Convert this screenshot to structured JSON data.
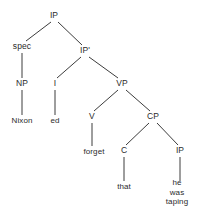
{
  "diagram": {
    "type": "constituency-tree",
    "width": 202,
    "height": 212,
    "background_color": "#ffffff",
    "line_color": "#3c3c3c",
    "text_color": "#2b2b2b",
    "nodes": [
      {
        "id": "ip-root",
        "label": "IP",
        "x": 54,
        "y": 16,
        "kind": "category"
      },
      {
        "id": "spec",
        "label": "spec",
        "x": 22,
        "y": 47,
        "kind": "category"
      },
      {
        "id": "ip-bar",
        "label": "IP'",
        "x": 85,
        "y": 51,
        "kind": "category"
      },
      {
        "id": "np",
        "label": "NP",
        "x": 22,
        "y": 84,
        "kind": "category"
      },
      {
        "id": "i",
        "label": "I",
        "x": 55,
        "y": 84,
        "kind": "category"
      },
      {
        "id": "vp",
        "label": "VP",
        "x": 122,
        "y": 84,
        "kind": "category"
      },
      {
        "id": "nixon",
        "label": "Nixon",
        "x": 22,
        "y": 121,
        "kind": "terminal"
      },
      {
        "id": "ed",
        "label": "ed",
        "x": 55,
        "y": 121,
        "kind": "terminal"
      },
      {
        "id": "v",
        "label": "V",
        "x": 92,
        "y": 117,
        "kind": "category"
      },
      {
        "id": "cp",
        "label": "CP",
        "x": 153,
        "y": 117,
        "kind": "category"
      },
      {
        "id": "forget",
        "label": "forget",
        "x": 94,
        "y": 152,
        "kind": "terminal"
      },
      {
        "id": "c",
        "label": "C",
        "x": 124,
        "y": 151,
        "kind": "category"
      },
      {
        "id": "ip-embed",
        "label": "IP",
        "x": 180,
        "y": 151,
        "kind": "category"
      },
      {
        "id": "that",
        "label": "that",
        "x": 124,
        "y": 187,
        "kind": "terminal"
      },
      {
        "id": "hewastaping",
        "label": "he was\ntaping",
        "x": 177,
        "y": 192,
        "kind": "terminal"
      }
    ],
    "edges": [
      {
        "from": "ip-root",
        "to": "spec",
        "x1": 51,
        "y1": 22,
        "x2": 26,
        "y2": 41
      },
      {
        "from": "ip-root",
        "to": "ip-bar",
        "x1": 58,
        "y1": 22,
        "x2": 82,
        "y2": 45
      },
      {
        "from": "spec",
        "to": "np",
        "x1": 22,
        "y1": 53,
        "x2": 22,
        "y2": 78
      },
      {
        "from": "np",
        "to": "nixon",
        "x1": 22,
        "y1": 90,
        "x2": 22,
        "y2": 115
      },
      {
        "from": "ip-bar",
        "to": "i",
        "x1": 81,
        "y1": 57,
        "x2": 57,
        "y2": 78
      },
      {
        "from": "ip-bar",
        "to": "vp",
        "x1": 89,
        "y1": 57,
        "x2": 118,
        "y2": 78
      },
      {
        "from": "i",
        "to": "ed",
        "x1": 55,
        "y1": 90,
        "x2": 55,
        "y2": 115
      },
      {
        "from": "vp",
        "to": "v",
        "x1": 118,
        "y1": 90,
        "x2": 94,
        "y2": 111
      },
      {
        "from": "vp",
        "to": "cp",
        "x1": 126,
        "y1": 90,
        "x2": 150,
        "y2": 111
      },
      {
        "from": "v",
        "to": "forget",
        "x1": 92,
        "y1": 123,
        "x2": 92,
        "y2": 146
      },
      {
        "from": "cp",
        "to": "c",
        "x1": 149,
        "y1": 123,
        "x2": 126,
        "y2": 145
      },
      {
        "from": "cp",
        "to": "ip-embed",
        "x1": 157,
        "y1": 123,
        "x2": 178,
        "y2": 145
      },
      {
        "from": "c",
        "to": "that",
        "x1": 124,
        "y1": 157,
        "x2": 124,
        "y2": 181
      },
      {
        "from": "ip-embed",
        "to": "hewastaping",
        "x1": 180,
        "y1": 157,
        "x2": 180,
        "y2": 181
      }
    ]
  }
}
